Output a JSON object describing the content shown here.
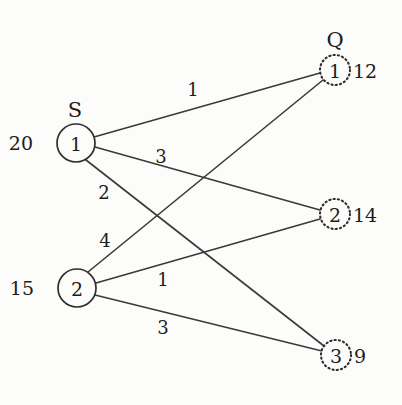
{
  "diagram": {
    "title_group_left": "S",
    "title_group_right": "Q",
    "type": "bipartite-transportation-network",
    "supply_nodes": [
      {
        "id": "S1",
        "label": "1",
        "supply": "20",
        "cx": 76,
        "cy": 143,
        "r": 19,
        "side_label_x": 33,
        "side_label_y": 143,
        "group_label_x": 75,
        "group_label_y": 110
      },
      {
        "id": "S2",
        "label": "2",
        "supply": "15",
        "cx": 77,
        "cy": 288,
        "r": 19,
        "side_label_x": 34,
        "side_label_y": 288
      }
    ],
    "demand_nodes": [
      {
        "id": "Q1",
        "label": "1",
        "demand": "12",
        "cx": 335,
        "cy": 70,
        "r": 15,
        "side_label_x": 353,
        "side_label_y": 71,
        "group_label_x": 335,
        "group_label_y": 40
      },
      {
        "id": "Q2",
        "label": "2",
        "demand": "14",
        "cx": 335,
        "cy": 214,
        "r": 15,
        "side_label_x": 353,
        "side_label_y": 215
      },
      {
        "id": "Q3",
        "label": "3",
        "demand": "9",
        "cx": 336,
        "cy": 355,
        "r": 15,
        "side_label_x": 354,
        "side_label_y": 356
      }
    ],
    "edges": [
      {
        "id": "S1-Q1",
        "from": "S1",
        "to": "Q1",
        "weight": "1",
        "x1": 94,
        "y1": 137,
        "x2": 320,
        "y2": 73,
        "label_x": 193,
        "label_y": 89
      },
      {
        "id": "S1-Q2",
        "from": "S1",
        "to": "Q2",
        "weight": "3",
        "x1": 95,
        "y1": 147,
        "x2": 320,
        "y2": 210,
        "label_x": 161,
        "label_y": 156
      },
      {
        "id": "S1-Q3",
        "from": "S1",
        "to": "Q3",
        "weight": "2",
        "x1": 86,
        "y1": 160,
        "x2": 324,
        "y2": 346,
        "label_x": 104,
        "label_y": 192
      },
      {
        "id": "S2-Q1",
        "from": "S2",
        "to": "Q1",
        "weight": "4",
        "x1": 88,
        "y1": 272,
        "x2": 323,
        "y2": 80,
        "label_x": 105,
        "label_y": 240
      },
      {
        "id": "S2-Q2",
        "from": "S2",
        "to": "Q2",
        "weight": "1",
        "x1": 96,
        "y1": 283,
        "x2": 320,
        "y2": 219,
        "label_x": 163,
        "label_y": 279
      },
      {
        "id": "S2-Q3",
        "from": "S2",
        "to": "Q3",
        "weight": "3",
        "x1": 95,
        "y1": 295,
        "x2": 322,
        "y2": 351,
        "label_x": 163,
        "label_y": 327
      }
    ],
    "colors": {
      "background": "#fcfcfb",
      "stroke": "#2e2e2e",
      "edge": "#3a3a3a",
      "text": "#1c1c1c"
    }
  }
}
